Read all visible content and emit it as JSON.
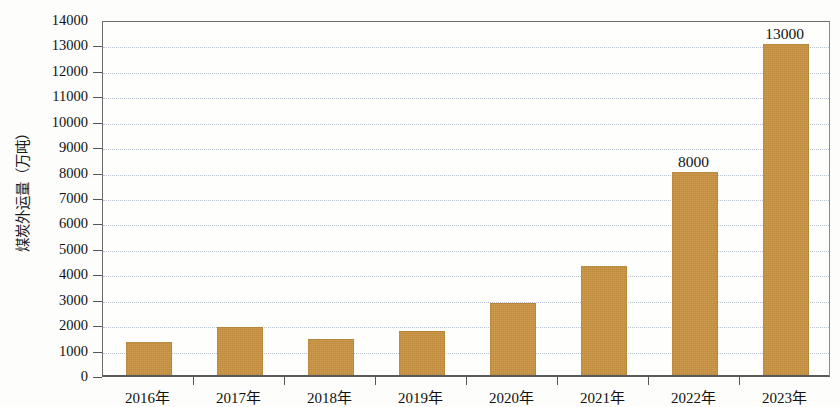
{
  "chart_data": {
    "type": "bar",
    "title": "",
    "xlabel": "",
    "ylabel": "煤炭外运量（万吨）",
    "categories": [
      "2016年",
      "2017年",
      "2018年",
      "2019年",
      "2020年",
      "2021年",
      "2022年",
      "2023年"
    ],
    "values": [
      1300,
      1870,
      1400,
      1730,
      2830,
      4300,
      8000,
      13000
    ],
    "value_labels": [
      "",
      "",
      "",
      "",
      "",
      "",
      "8000",
      "13000"
    ],
    "ylim": [
      0,
      14000
    ],
    "ytick_step": 1000,
    "ytick_labels": [
      "0",
      "1000",
      "2000",
      "3000",
      "4000",
      "5000",
      "6000",
      "7000",
      "8000",
      "9000",
      "10000",
      "11000",
      "12000",
      "13000",
      "14000"
    ],
    "ytick_values": [
      0,
      1000,
      2000,
      3000,
      4000,
      5000,
      6000,
      7000,
      8000,
      9000,
      10000,
      11000,
      12000,
      13000,
      14000
    ],
    "grid": true,
    "grid_axis": "y",
    "legend": false,
    "legend_position": "none",
    "bar_color": "#c8923f",
    "gridline_color": "#b9c2d0",
    "axis_color": "#5a5a5a",
    "background_color": "#fdfdfb",
    "text_color": "#111111"
  }
}
